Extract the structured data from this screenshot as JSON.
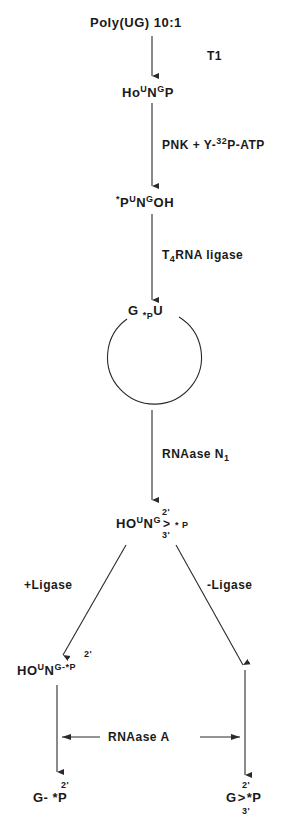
{
  "diagram": {
    "start": "Poly(UG) 10:1",
    "step1_enzyme": "T1",
    "step1_product": {
      "prefix": "Ho",
      "sup1": "U",
      "main": "N",
      "sup2": "G",
      "suffix": "P"
    },
    "step2_enzyme": {
      "prefix": "PNK + Y-",
      "sup": "32",
      "suffix": "P-ATP"
    },
    "step2_product": {
      "star": "*",
      "p": "P",
      "sup1": "U",
      "main": "N",
      "sup2": "G",
      "suffix": "OH"
    },
    "step3_enzyme": {
      "prefix": "T",
      "sub": "4",
      "suffix": "RNA ligase"
    },
    "circle_label": {
      "g": "G",
      "star": "*",
      "p": "P",
      "u": "U"
    },
    "step4_enzyme": {
      "prefix": "RNAase N",
      "sub": "1"
    },
    "step4_product": {
      "prefix": "HO",
      "sup1": "U",
      "main": "N",
      "sup2": "G",
      "top": "2'",
      "mid": ">",
      "bottom": "3'",
      "suffix": "* P"
    },
    "branch_left_label": "+Ligase",
    "branch_right_label": "-Ligase",
    "left_product": {
      "prefix": "HO",
      "sup1": "U",
      "main": "N",
      "sup2": "G-*P",
      "top": "2'"
    },
    "shared_enzyme": "RNAase A",
    "final_left": {
      "main": "G- *P",
      "top": "2'"
    },
    "final_right": {
      "g": "G",
      "mid": ">",
      "suffix": "*P",
      "top": "2'",
      "bottom": "3'"
    }
  },
  "colors": {
    "line": "#2a2a2a",
    "text": "#1a1a1a",
    "background": "#ffffff"
  }
}
